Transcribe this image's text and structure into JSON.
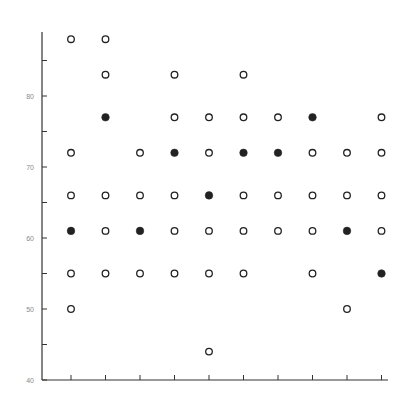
{
  "chart_data": {
    "type": "scatter",
    "title": "",
    "xlabel": "",
    "ylabel": "",
    "ylim": [
      40,
      89
    ],
    "yticks": [
      40,
      45,
      50,
      55,
      60,
      65,
      70,
      75,
      80,
      85
    ],
    "ytick_labels": [
      "40",
      "50",
      "60",
      "70",
      "80"
    ],
    "x_categories": [
      1,
      2,
      3,
      4,
      5,
      6,
      7,
      8,
      9,
      10
    ],
    "x_tick_labels_visible": false,
    "grid": false,
    "legend": null,
    "marker_legend": {
      "open": "open circle",
      "filled": "filled circle"
    },
    "colors": {
      "axis": "#333333",
      "marker": "#222222",
      "label": "#8a8a8a"
    },
    "series": [
      {
        "name": "open",
        "points": [
          {
            "x": 1,
            "y": 88
          },
          {
            "x": 1,
            "y": 72
          },
          {
            "x": 1,
            "y": 66
          },
          {
            "x": 1,
            "y": 55
          },
          {
            "x": 1,
            "y": 50
          },
          {
            "x": 2,
            "y": 88
          },
          {
            "x": 2,
            "y": 83
          },
          {
            "x": 2,
            "y": 66
          },
          {
            "x": 2,
            "y": 61
          },
          {
            "x": 2,
            "y": 55
          },
          {
            "x": 3,
            "y": 72
          },
          {
            "x": 3,
            "y": 66
          },
          {
            "x": 3,
            "y": 55
          },
          {
            "x": 4,
            "y": 83
          },
          {
            "x": 4,
            "y": 77
          },
          {
            "x": 4,
            "y": 66
          },
          {
            "x": 4,
            "y": 61
          },
          {
            "x": 4,
            "y": 55
          },
          {
            "x": 5,
            "y": 77
          },
          {
            "x": 5,
            "y": 72
          },
          {
            "x": 5,
            "y": 61
          },
          {
            "x": 5,
            "y": 55
          },
          {
            "x": 5,
            "y": 44
          },
          {
            "x": 6,
            "y": 83
          },
          {
            "x": 6,
            "y": 77
          },
          {
            "x": 6,
            "y": 66
          },
          {
            "x": 6,
            "y": 61
          },
          {
            "x": 6,
            "y": 55
          },
          {
            "x": 7,
            "y": 77
          },
          {
            "x": 7,
            "y": 66
          },
          {
            "x": 7,
            "y": 61
          },
          {
            "x": 8,
            "y": 72
          },
          {
            "x": 8,
            "y": 66
          },
          {
            "x": 8,
            "y": 61
          },
          {
            "x": 8,
            "y": 55
          },
          {
            "x": 9,
            "y": 72
          },
          {
            "x": 9,
            "y": 66
          },
          {
            "x": 9,
            "y": 50
          },
          {
            "x": 10,
            "y": 77
          },
          {
            "x": 10,
            "y": 72
          },
          {
            "x": 10,
            "y": 66
          },
          {
            "x": 10,
            "y": 61
          }
        ]
      },
      {
        "name": "filled",
        "points": [
          {
            "x": 1,
            "y": 61
          },
          {
            "x": 2,
            "y": 77
          },
          {
            "x": 3,
            "y": 61
          },
          {
            "x": 4,
            "y": 72
          },
          {
            "x": 5,
            "y": 66
          },
          {
            "x": 6,
            "y": 72
          },
          {
            "x": 7,
            "y": 72
          },
          {
            "x": 8,
            "y": 77
          },
          {
            "x": 9,
            "y": 61
          },
          {
            "x": 10,
            "y": 55
          }
        ]
      }
    ]
  }
}
